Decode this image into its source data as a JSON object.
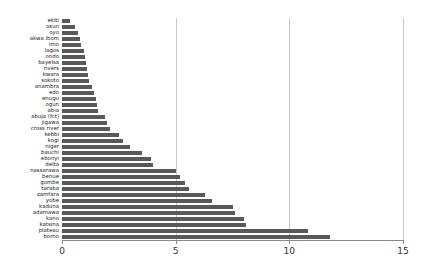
{
  "chart_data": {
    "type": "bar",
    "orientation": "horizontal",
    "title": "",
    "subtitle": "",
    "xlabel": "",
    "ylabel": "",
    "xlim": [
      0,
      15
    ],
    "ylim": null,
    "grid": true,
    "gridlines_x": [
      5,
      10,
      15
    ],
    "legend": null,
    "legend_position": "none",
    "bar_color": "#595959",
    "axis_color": "#8a8a8a",
    "xticks": [
      0,
      5,
      10,
      15
    ],
    "xtick_labels": [
      "0",
      "5",
      "10",
      "15"
    ],
    "categories": [
      "ekiti",
      "osun",
      "oyo",
      "akwa ibom",
      "imo",
      "lagos",
      "ondo",
      "bayelsa",
      "rivers",
      "kwara",
      "sokoto",
      "anambra",
      "edo",
      "enugu",
      "ogun",
      "abia",
      "abuja (fct)",
      "jigawa",
      "cross river",
      "kebbi",
      "kogi",
      "niger",
      "bauchi",
      "ebonyi",
      "delta",
      "nassarawa",
      "benue",
      "gombe",
      "taraba",
      "zamfara",
      "yobe",
      "kaduna",
      "adamawa",
      "kano",
      "katsina",
      "plateau",
      "borno"
    ],
    "values": [
      0.35,
      0.55,
      0.7,
      0.8,
      0.85,
      0.95,
      1.0,
      1.05,
      1.1,
      1.15,
      1.2,
      1.3,
      1.4,
      1.5,
      1.55,
      1.6,
      1.9,
      2.0,
      2.1,
      2.5,
      2.7,
      3.0,
      3.5,
      3.9,
      4.0,
      5.0,
      5.2,
      5.4,
      5.6,
      6.3,
      6.6,
      7.5,
      7.6,
      8.0,
      8.1,
      10.8,
      11.8
    ]
  }
}
